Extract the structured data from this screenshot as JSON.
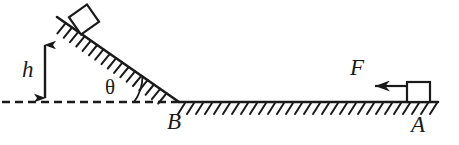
{
  "figure": {
    "type": "physics-free-body-diagram",
    "stroke_color": "#1a1a1a",
    "background_color": "#ffffff",
    "width": 459,
    "height": 145
  },
  "labels": {
    "height": "h",
    "angle": "θ",
    "point_b": "B",
    "point_a": "A",
    "force": "F"
  },
  "geometry": {
    "incline": {
      "x1": 57,
      "y1": 17,
      "x2": 178,
      "y2": 102
    },
    "ground": {
      "x1": 178,
      "y1": 102,
      "x2": 438,
      "y2": 102
    },
    "dashed_baseline": {
      "x1": 2,
      "y1": 102,
      "x2": 178,
      "y2": 102
    },
    "height_arrow": {
      "x": 45,
      "y_top": 42,
      "y_bottom": 101
    },
    "force_arrow": {
      "x_tail": 405,
      "x_head": 360,
      "y": 86
    },
    "block_incline": {
      "cx": 84,
      "cy": 20,
      "size": 22,
      "rotation_deg": -35
    },
    "block_ground": {
      "x": 407,
      "y": 82,
      "w": 23,
      "h": 20
    },
    "angle_arc_radius": 44
  },
  "annotations": {
    "height_arrow_name": "double-headed vertical height arrow",
    "force_arrow_name": "leftward applied force arrow",
    "hatching_incline": "friction hatching below incline surface",
    "hatching_ground": "friction hatching below horizontal ground"
  }
}
